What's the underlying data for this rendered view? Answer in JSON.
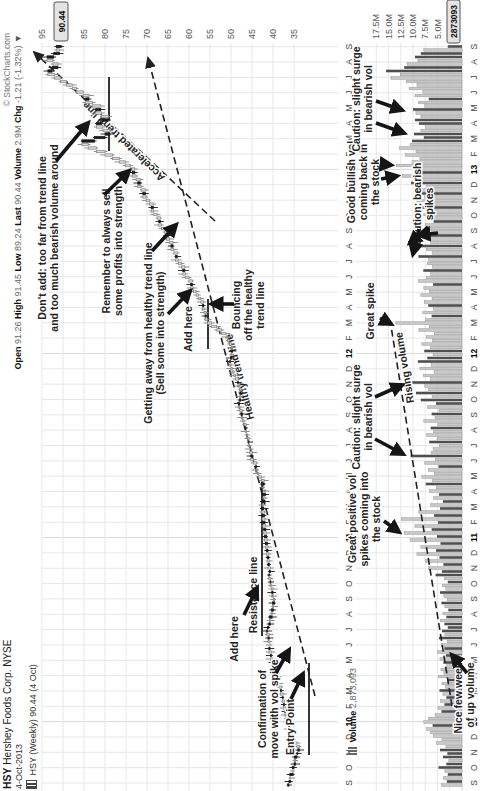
{
  "header": {
    "symbol": "HSY",
    "name": "Hershey Foods Corp. NYSE",
    "credit": "© StockCharts.com",
    "date": "4-Oct-2013",
    "ohlc": [
      {
        "label": "Open",
        "value": "91.26"
      },
      {
        "label": "High",
        "value": "91.45"
      },
      {
        "label": "Low",
        "value": "89.24"
      },
      {
        "label": "Last",
        "value": "90.44"
      },
      {
        "label": "Volume",
        "value": "2.9M"
      },
      {
        "label": "Chg",
        "value": "-1.21 (-1.32%)"
      }
    ],
    "change_arrow": "▼",
    "series": "HSY (Weekly) 90.44 (4 Oct)",
    "volume_label": "Volume",
    "volume_value": "2,873,093"
  },
  "colors": {
    "up_candle": "#d9d9d9",
    "up_stroke": "#838383",
    "down_candle": "#1b1b1b",
    "vol_up": "#c8c8c8",
    "vol_up_stroke": "#9a9a9a",
    "vol_down": "#4f4f4f",
    "grid": "#e7e7e7",
    "grid_dark": "#d9d9d9",
    "axis_text": "#555",
    "annotation": "#242424",
    "arrow": "#151515",
    "trend": "#222",
    "box_bg": "#e4e4e4",
    "box_border": "#555",
    "level": "#111"
  },
  "chart_data": {
    "type": "candlestick+volume",
    "timeframe": "weekly",
    "x_range": "Sep 2009 - Oct 2013",
    "price_ylim": [
      33,
      96
    ],
    "price_gridlines": [
      95,
      90,
      85,
      80,
      75,
      70,
      65,
      60,
      55,
      50,
      45,
      40,
      35
    ],
    "price_axis_labels": [
      95,
      85,
      80,
      75,
      70,
      65,
      60,
      55,
      50,
      45,
      40,
      35
    ],
    "price_axis_current": "90.44",
    "volume_gridlines_m": [
      17.5,
      15.0,
      12.5,
      10.0,
      7.5,
      5.0,
      2.5
    ],
    "volume_axis_labels": [
      "17.5M",
      "15.0M",
      "12.5M",
      "10.0M",
      "7.5M",
      "5.0M"
    ],
    "volume_axis_current": "2873093",
    "date_axis": [
      "S",
      "O",
      "N",
      "D",
      "10",
      "F",
      "M",
      "A",
      "M",
      "J",
      "J",
      "A",
      "S",
      "O",
      "N",
      "D",
      "11",
      "F",
      "M",
      "A",
      "M",
      "J",
      "J",
      "A",
      "S",
      "O",
      "N",
      "D",
      "12",
      "F",
      "M",
      "A",
      "M",
      "J",
      "J",
      "A",
      "S",
      "O",
      "N",
      "D",
      "13",
      "F",
      "M",
      "A",
      "M",
      "J",
      "J",
      "A",
      "S"
    ],
    "last_bar": {
      "open": 91.26,
      "high": 91.45,
      "low": 89.24,
      "close": 90.44,
      "volume": "2.9M",
      "change": "-1.21 (-1.32%)"
    },
    "closes": [
      36.2,
      35.8,
      36.0,
      35.2,
      35.4,
      35.0,
      34.6,
      34.9,
      34.3,
      34.1,
      33.7,
      34.3,
      34.8,
      35.1,
      35.4,
      35.9,
      36.3,
      36.2,
      36.7,
      36.9,
      37.2,
      37.0,
      37.5,
      37.3,
      37.8,
      37.6,
      38.2,
      38.0,
      38.6,
      38.9,
      38.7,
      39.3,
      39.6,
      39.9,
      40.3,
      40.1,
      40.6,
      40.4,
      41.0,
      40.7,
      40.9,
      41.2,
      40.9,
      41.5,
      41.3,
      41.0,
      40.6,
      40.8,
      40.2,
      40.4,
      39.9,
      40.1,
      39.6,
      39.9,
      40.3,
      40.0,
      40.4,
      40.7,
      40.5,
      41.0,
      40.9,
      40.6,
      41.2,
      40.8,
      41.4,
      41.0,
      41.6,
      41.2,
      41.8,
      41.3,
      42.0,
      41.5,
      42.2,
      41.7,
      42.4,
      41.9,
      42.6,
      42.0,
      42.8,
      42.2,
      42.5,
      41.9,
      42.3,
      41.8,
      42.2,
      42.4,
      42.1,
      42.8,
      43.4,
      43.7,
      44.1,
      43.9,
      44.6,
      45.3,
      44.9,
      45.5,
      45.6,
      45.9,
      45.7,
      46.1,
      46.3,
      46.6,
      46.4,
      46.9,
      47.2,
      47.5,
      47.3,
      47.9,
      48.2,
      48.0,
      47.7,
      47.9,
      47.6,
      48.0,
      48.4,
      48.2,
      48.9,
      49.3,
      49.7,
      50.0,
      50.3,
      50.1,
      49.8,
      50.0,
      49.6,
      49.9,
      50.4,
      50.8,
      51.2,
      52.2,
      53.4,
      54.6,
      55.6,
      56.2,
      55.9,
      56.4,
      56.8,
      56.5,
      57.2,
      57.8,
      58.3,
      58.9,
      59.6,
      59.2,
      60.0,
      60.8,
      61.5,
      61.0,
      61.8,
      62.5,
      63.2,
      62.8,
      63.6,
      64.3,
      63.8,
      64.6,
      65.4,
      64.9,
      65.8,
      66.6,
      67.2,
      66.8,
      67.6,
      68.4,
      69.0,
      68.5,
      69.4,
      70.2,
      71.0,
      70.4,
      71.4,
      72.2,
      71.6,
      72.6,
      73.5,
      72.9,
      74.0,
      75.2,
      76.6,
      78.2,
      80.0,
      82.0,
      84.0,
      85.5,
      82.5,
      80.0,
      78.8,
      80.5,
      82.0,
      80.8,
      79.2,
      80.8,
      82.2,
      81.0,
      83.0,
      84.6,
      83.8,
      85.2,
      86.8,
      87.8,
      89.2,
      90.6,
      92.0,
      93.6,
      92.6,
      91.2,
      92.4,
      93.8,
      92.2,
      90.8,
      91.6,
      90.44
    ],
    "volumes_m": [
      4.2,
      3.1,
      3.8,
      2.9,
      3.5,
      4.8,
      3.2,
      2.7,
      3.9,
      3.0,
      4.5,
      3.3,
      5.2,
      4.1,
      5.8,
      6.4,
      7.2,
      6.0,
      7.8,
      6.8,
      5.5,
      4.2,
      4.9,
      3.6,
      4.4,
      3.2,
      3.9,
      4.6,
      3.4,
      4.1,
      3.0,
      4.8,
      3.7,
      4.3,
      3.1,
      3.8,
      4.5,
      3.3,
      5.0,
      3.6,
      4.2,
      3.0,
      4.7,
      3.5,
      4.1,
      2.9,
      3.6,
      4.4,
      3.2,
      3.9,
      2.8,
      3.5,
      4.2,
      3.0,
      3.7,
      4.5,
      3.3,
      4.0,
      2.9,
      3.6,
      5.4,
      4.1,
      6.8,
      3.8,
      7.5,
      4.6,
      9.2,
      5.3,
      8.4,
      4.4,
      10.6,
      5.1,
      11.8,
      6.2,
      9.6,
      4.9,
      12.4,
      5.7,
      8.8,
      4.5,
      6.4,
      3.9,
      5.8,
      4.7,
      6.6,
      5.2,
      7.4,
      6.1,
      8.2,
      5.6,
      6.9,
      4.8,
      7.6,
      5.4,
      10.5,
      6.3,
      5.9,
      4.6,
      6.7,
      5.1,
      7.2,
      5.8,
      6.4,
      4.9,
      7.8,
      5.5,
      6.2,
      4.7,
      7.0,
      5.3,
      8.4,
      6.1,
      9.4,
      6.8,
      7.6,
      11.0,
      6.5,
      7.9,
      5.7,
      8.6,
      6.3,
      9.0,
      7.1,
      5.9,
      7.7,
      6.4,
      8.2,
      6.0,
      7.3,
      5.6,
      8.8,
      6.7,
      13.5,
      7.4,
      6.2,
      8.0,
      5.8,
      6.9,
      7.7,
      6.1,
      8.4,
      6.6,
      7.8,
      5.9,
      8.9,
      7.2,
      6.4,
      7.9,
      6.0,
      7.1,
      6.8,
      8.9,
      6.1,
      7.3,
      9.5,
      6.4,
      7.0,
      8.8,
      6.2,
      7.1,
      7.4,
      5.8,
      6.9,
      7.8,
      6.2,
      8.5,
      7.0,
      9.2,
      7.6,
      8.3,
      9.0,
      7.2,
      10.4,
      8.1,
      12.2,
      8.8,
      9.6,
      13.4,
      10.2,
      8.6,
      11.5,
      9.4,
      12.8,
      10.6,
      10.2,
      7.8,
      9.8,
      8.4,
      7.4,
      8.8,
      9.6,
      8.4,
      9.4,
      10.0,
      7.6,
      8.9,
      6.8,
      9.6,
      8.0,
      10.8,
      9.2,
      11.4,
      14.5,
      12.6,
      15.5,
      11.8,
      11.2,
      9.0,
      9.6,
      8.4,
      7.8,
      2.9
    ]
  },
  "annotations": {
    "price": [
      {
        "lines": [
          "Don't add: too far from trend line",
          "and too much bearish volume around"
        ],
        "x": 553,
        "y": 46,
        "arrows": [
          [
            630,
            56,
            668,
            88
          ]
        ]
      },
      {
        "lines": [
          "Remember to always sell",
          "some profits into strength"
        ],
        "x": 540,
        "y": 110,
        "arrows": [
          [
            596,
            104,
            620,
            129
          ]
        ]
      },
      {
        "lines": [
          "Getting away from healthy trend line",
          "(Sell some into strength)"
        ],
        "x": 458,
        "y": 152,
        "arrows": [
          [
            540,
            152,
            566,
            176
          ]
        ]
      },
      {
        "lines": [
          "Add here"
        ],
        "x": 462,
        "y": 192,
        "arrows": [
          [
            477,
            168,
            500,
            190
          ]
        ]
      },
      {
        "lines": [
          "Bouncing",
          "off the healthy",
          "trend line"
        ],
        "x": 486,
        "y": 240,
        "arrows": [
          [
            487,
            234,
            487,
            212
          ]
        ]
      },
      {
        "lines": [
          "Add here"
        ],
        "x": 152,
        "y": 238,
        "arrows": [
          [
            176,
            244,
            203,
            257
          ]
        ]
      },
      {
        "lines": [
          "Confirmation of",
          "move with vol spike"
        ],
        "x": 82,
        "y": 266,
        "arrows": [
          [
            118,
            276,
            141,
            289
          ]
        ]
      },
      {
        "lines": [
          "Entry Point"
        ],
        "x": 64,
        "y": 294,
        "arrows": [
          [
            92,
            291,
            117,
            303
          ]
        ]
      }
    ],
    "volume": [
      {
        "lines": [
          "Nice few weeks",
          "of up volume"
        ],
        "x": 96,
        "y": 462,
        "arrows": [
          [
            118,
            467,
            136,
            452
          ]
        ]
      },
      {
        "lines": [
          "Great positive vol",
          "spikes coming into",
          "the stock"
        ],
        "x": 272,
        "y": 356,
        "arrows": [
          [
            270,
            384,
            259,
            399
          ]
        ]
      },
      {
        "lines": [
          "Caution: slight surge",
          "in bearish vol"
        ],
        "x": 374,
        "y": 360,
        "arrows": [
          [
            352,
            375,
            337,
            403
          ],
          [
            394,
            375,
            406,
            402
          ]
        ]
      },
      {
        "lines": [
          "Great spike"
        ],
        "x": 480,
        "y": 374,
        "arrows": [
          [
            473,
            380,
            467,
            391
          ]
        ]
      },
      {
        "lines": [
          "Caution: bearish",
          "spikes"
        ],
        "x": 587,
        "y": 421,
        "arrows": [
          [
            562,
            419,
            537,
            413
          ],
          [
            564,
            428,
            548,
            410
          ],
          [
            558,
            438,
            556,
            419
          ]
        ]
      },
      {
        "lines": [
          "Good bullish vol",
          "coming back in",
          "the stock"
        ],
        "x": 609,
        "y": 355,
        "arrows": [
          [
            612,
            381,
            615,
            397
          ],
          [
            627,
            381,
            626,
            391
          ]
        ]
      },
      {
        "lines": [
          "Caution: slight surge",
          "in bearish vol"
        ],
        "x": 692,
        "y": 360,
        "arrows": [
          [
            668,
            376,
            658,
            404
          ],
          [
            690,
            376,
            681,
            402
          ]
        ]
      }
    ],
    "trend_lines": [
      {
        "name": "healthy-trend-line",
        "x1": 95,
        "y1": 315,
        "x2": 733,
        "y2": 148,
        "label": "Healthy trend line",
        "label_x": 415,
        "label_y": 243,
        "label_angle": -14.5,
        "arrow": true
      },
      {
        "name": "accelerated-trend-line",
        "x1": 570,
        "y1": 215,
        "x2": 739,
        "y2": 34,
        "label": "Accelerated trend line",
        "label_x": 652,
        "label_y": 126,
        "label_angle": -46,
        "arrow": true
      },
      {
        "name": "rising-volume-line",
        "x1": 85,
        "y1": 452,
        "x2": 465,
        "y2": 391,
        "label": "Rising volume",
        "label_x": 424,
        "label_y": 408,
        "label_angle": -9.5,
        "arrow": false
      }
    ],
    "levels": [
      {
        "name": "resistance-line",
        "label": "Resistance line",
        "y": 262,
        "x1": 155,
        "x2": 312,
        "label_x": 196,
        "label_y": 257
      },
      {
        "name": "add-here-shelf",
        "label": "",
        "y": 208,
        "x1": 442,
        "x2": 492
      },
      {
        "name": "support-2013",
        "label": "",
        "y": 109,
        "x1": 640,
        "x2": 714
      },
      {
        "name": "entry-line",
        "label": "",
        "y": 309,
        "x1": 36,
        "x2": 128
      }
    ]
  }
}
